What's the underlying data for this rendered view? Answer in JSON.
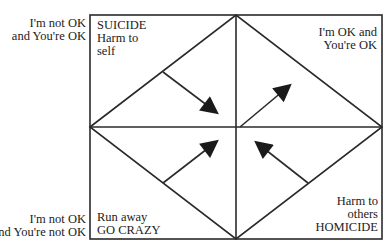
{
  "diagram": {
    "colors": {
      "line": "#2a2a2a",
      "background": "#ffffff",
      "text": "#222222"
    },
    "outer_labels": {
      "top_left": [
        "I'm not OK",
        "and You're OK"
      ],
      "bottom_left": [
        "I'm not OK",
        "and You're not OK"
      ]
    },
    "quadrants": {
      "top_left": [
        "SUICIDE",
        "Harm to",
        "self"
      ],
      "top_right": [
        "I'm OK and",
        "You're OK"
      ],
      "bottom_left": [
        "Run away",
        "GO CRAZY"
      ],
      "bottom_right": [
        "Harm to",
        "others",
        "HOMICIDE"
      ]
    },
    "arrows": [
      {
        "name": "arrow-top-left-to-center",
        "from": [
          163,
          72
        ],
        "to": [
          216,
          112
        ]
      },
      {
        "name": "arrow-center-to-top-right",
        "from": [
          240,
          127
        ],
        "to": [
          289,
          86
        ]
      },
      {
        "name": "arrow-bottom-left-to-center",
        "from": [
          163,
          183
        ],
        "to": [
          216,
          142
        ]
      },
      {
        "name": "arrow-bottom-right-to-center",
        "from": [
          308,
          183
        ],
        "to": [
          257,
          143
        ]
      }
    ]
  }
}
